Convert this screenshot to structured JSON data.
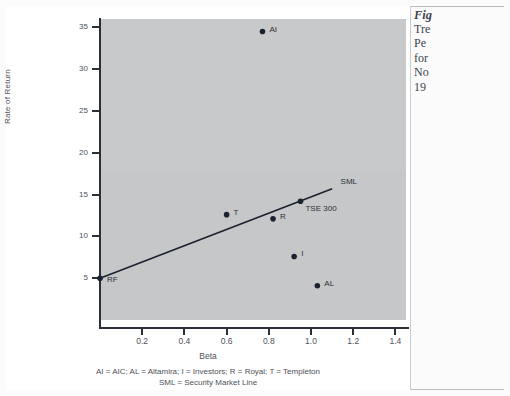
{
  "figure": {
    "plot_bg_color": "#c5c7c9",
    "axis_color": "#2b2f38",
    "point_color": "#1b2330",
    "line_color": "#1b2330"
  },
  "margin_note": {
    "heading": "Fig",
    "lines": [
      "Tre",
      "Pe",
      "for",
      "No",
      "19"
    ]
  },
  "caption": {
    "line1": "AI = AIC; AL = Altamira; I = Investors; R = Royal; T = Templeton",
    "line2": "SML = Security Market Line"
  },
  "chart_data": {
    "type": "scatter",
    "title": "",
    "xlabel": "Beta",
    "ylabel": "Rate of Return",
    "xlim": [
      0,
      1.45
    ],
    "ylim": [
      0,
      36
    ],
    "xticks": [
      "0.2",
      "0.4",
      "0.6",
      "0.8",
      "1.0",
      "1.2",
      "1.4"
    ],
    "xtick_values": [
      0.2,
      0.4,
      0.6,
      0.8,
      1.0,
      1.2,
      1.4
    ],
    "yticks": [
      "5",
      "10",
      "15",
      "20",
      "25",
      "30",
      "35"
    ],
    "ytick_values": [
      5,
      10,
      15,
      20,
      25,
      30,
      35
    ],
    "grid": false,
    "legend": "none",
    "points": [
      {
        "label": "AI",
        "x": 0.77,
        "y": 34.5,
        "label_dx": 7,
        "label_dy": -3
      },
      {
        "label": "T",
        "x": 0.6,
        "y": 12.6,
        "label_dx": 7,
        "label_dy": -3
      },
      {
        "label": "R",
        "x": 0.82,
        "y": 12.1,
        "label_dx": 7,
        "label_dy": -3
      },
      {
        "label": "TSE 300",
        "x": 0.95,
        "y": 14.2,
        "label_dx": 5,
        "label_dy": 7
      },
      {
        "label": "I",
        "x": 0.92,
        "y": 7.6,
        "label_dx": 7,
        "label_dy": -3
      },
      {
        "label": "AL",
        "x": 1.03,
        "y": 4.1,
        "label_dx": 7,
        "label_dy": -3
      },
      {
        "label": "RF",
        "x": 0.0,
        "y": 5.0,
        "label_dx": 7,
        "label_dy": 1
      }
    ],
    "line": {
      "name": "SML",
      "label": "SML",
      "x0": 0.0,
      "y0": 5.0,
      "x1": 1.1,
      "y1": 15.7,
      "label_x": 1.14,
      "label_y": 16.6
    },
    "annotations": [
      "AI = AIC; AL = Altamira; I = Investors; R = Royal; T = Templeton",
      "SML = Security Market Line"
    ]
  }
}
